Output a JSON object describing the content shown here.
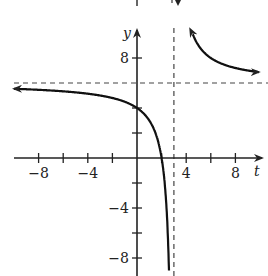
{
  "chart_data": {
    "type": "line",
    "title": "",
    "xlabel": "t",
    "ylabel": "y",
    "xlim": [
      -10,
      10
    ],
    "ylim": [
      -9,
      11
    ],
    "grid": false,
    "legend": null,
    "function": "y = 6 + 6/(t - 3)",
    "x_ticks": [
      -8,
      -6,
      -4,
      -2,
      2,
      4,
      6,
      8
    ],
    "x_tick_labels": [
      {
        "value": -8,
        "label": "−8"
      },
      {
        "value": -4,
        "label": "−4"
      },
      {
        "value": 4,
        "label": "4"
      },
      {
        "value": 8,
        "label": "8"
      }
    ],
    "y_ticks": [
      -8,
      -6,
      -4,
      -2,
      2,
      4,
      8
    ],
    "y_tick_labels": [
      {
        "value": 8,
        "label": "8"
      },
      {
        "value": -4,
        "label": "−4"
      },
      {
        "value": -8,
        "label": "−8"
      }
    ],
    "asymptotes": {
      "vertical": {
        "t": 3,
        "style": "dashed"
      },
      "horizontal": {
        "y": 6,
        "style": "dashed"
      }
    },
    "series": [
      {
        "name": "left branch",
        "points": [
          [
            -10,
            5.54
          ],
          [
            -8,
            5.45
          ],
          [
            -6,
            5.33
          ],
          [
            -4,
            5.14
          ],
          [
            -2,
            4.8
          ],
          [
            -1,
            4.5
          ],
          [
            0,
            4
          ],
          [
            1,
            3
          ],
          [
            1.5,
            2
          ],
          [
            2,
            0
          ],
          [
            2.25,
            -2
          ],
          [
            2.4,
            -4
          ],
          [
            2.5,
            -6
          ],
          [
            2.57,
            -8
          ],
          [
            2.6,
            -9
          ]
        ],
        "arrow_left": true
      },
      {
        "name": "right branch",
        "points": [
          [
            3.55,
            16.9
          ],
          [
            3.7,
            14.6
          ],
          [
            4,
            12
          ],
          [
            5,
            9
          ],
          [
            6,
            8
          ],
          [
            7,
            7.5
          ],
          [
            8,
            7.2
          ],
          [
            9.8,
            6.88
          ]
        ],
        "arrow_both": true
      }
    ],
    "key_points": [
      {
        "t": 0,
        "y": 4,
        "note": "y-intercept"
      },
      {
        "t": 2,
        "y": 0,
        "note": "t-intercept"
      }
    ]
  }
}
